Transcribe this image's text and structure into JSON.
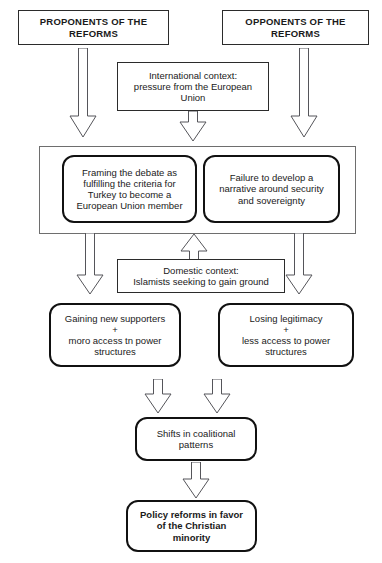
{
  "diagram": {
    "nodes": {
      "proponents": "PROPONENTS OF THE REFORMS",
      "opponents": "OPPONENTS OF THE REFORMS",
      "international_context": "International context: pressure from the European Union",
      "framing": "Framing the debate as fulfilling the criteria for Turkey to become a European Union member",
      "failure": "Failure to develop a narrative around security and sovereignty",
      "domestic_context": "Domestic context: Islamists seeking to gain ground",
      "gaining": "Gaining new supporters + moro access tn power structures",
      "losing": "Losing legitimacy + less access to power structures",
      "shifts": "Shifts in coalitional patterns",
      "policy": "Policy reforms in favor of the Christian minority"
    },
    "node_lines": {
      "proponents": [
        "PROPONENTS OF THE",
        "REFORMS"
      ],
      "opponents": [
        "OPPONENTS OF THE",
        "REFORMS"
      ],
      "international_context_l1": "International context:",
      "international_context_l2": "pressure from the European",
      "international_context_l3": "Union",
      "framing_l1": "Framing the debate as",
      "framing_l2": "fulfilling the criteria for",
      "framing_l3": "Turkey to become a",
      "framing_l4": "European Union member",
      "failure_l1": "Failure to develop a",
      "failure_l2": "narrative around security",
      "failure_l3": "and sovereignty",
      "domestic_l1": "Domestic context:",
      "domestic_l2": "Islamists seeking to gain ground",
      "gaining_l1": "Gaining new supporters",
      "gaining_l2": "+",
      "gaining_l3": "moro access tn power",
      "gaining_l4": "structures",
      "losing_l1": "Losing legitimacy",
      "losing_l2": "+",
      "losing_l3": "less access to power",
      "losing_l4": "structures",
      "shifts_l1": "Shifts in coalitional",
      "shifts_l2": "patterns",
      "policy_l1": "Policy reforms in favor",
      "policy_l2": "of the Christian",
      "policy_l3": "minority"
    },
    "colors": {
      "background": "#ffffff",
      "text": "#1a1a1a",
      "thin_border": "#2b2b2b",
      "thick_border": "#111111",
      "frame_border": "#6e6e6e",
      "arrow_stroke": "#55555a",
      "arrow_fill": "#ffffff"
    },
    "arrows": [
      {
        "name": "proponents-to-framing",
        "direction": "down",
        "length": "long"
      },
      {
        "name": "opponents-to-failure",
        "direction": "down",
        "length": "long"
      },
      {
        "name": "international-context-to-group",
        "direction": "down",
        "length": "short"
      },
      {
        "name": "framing-to-gaining",
        "direction": "down",
        "length": "medium"
      },
      {
        "name": "failure-to-losing",
        "direction": "down",
        "length": "medium"
      },
      {
        "name": "domestic-context-to-group",
        "direction": "up",
        "length": "short"
      },
      {
        "name": "gaining-to-shifts",
        "direction": "down",
        "length": "short"
      },
      {
        "name": "losing-to-shifts",
        "direction": "down",
        "length": "short"
      },
      {
        "name": "shifts-to-policy",
        "direction": "down",
        "length": "short"
      }
    ]
  }
}
